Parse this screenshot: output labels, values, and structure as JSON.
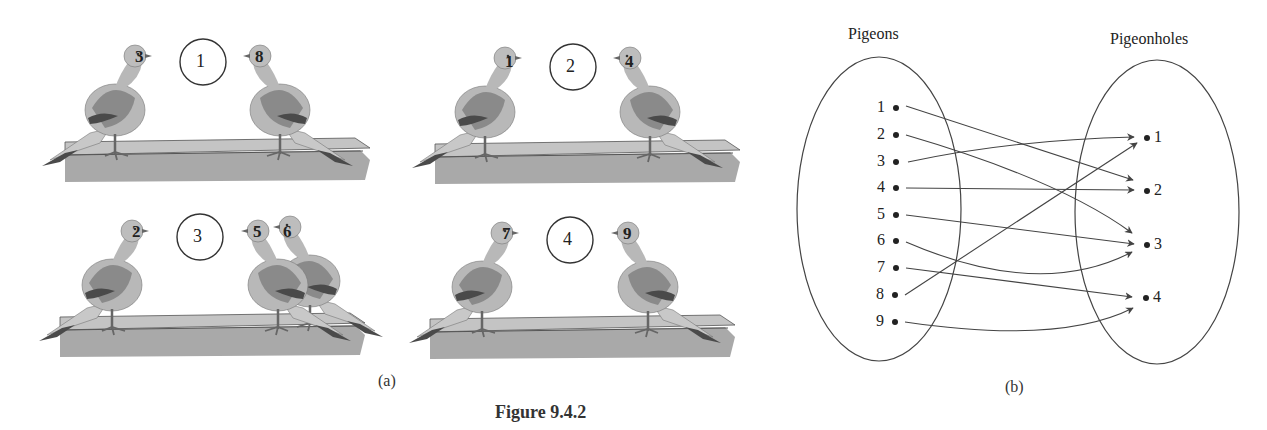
{
  "figure": {
    "title": "Figure 9.4.2",
    "panel_a_caption": "(a)",
    "panel_b_caption": "(b)"
  },
  "panel_a": {
    "cells": [
      {
        "hole": "1",
        "left_pigeons": [
          "3"
        ],
        "right_pigeons": [
          "8"
        ]
      },
      {
        "hole": "2",
        "left_pigeons": [
          "1"
        ],
        "right_pigeons": [
          "4"
        ]
      },
      {
        "hole": "3",
        "left_pigeons": [
          "2"
        ],
        "right_pigeons": [
          "5",
          "6"
        ]
      },
      {
        "hole": "4",
        "left_pigeons": [
          "7"
        ],
        "right_pigeons": [
          "9"
        ]
      }
    ]
  },
  "panel_b": {
    "pigeons_label": "Pigeons",
    "pigeonholes_label": "Pigeonholes",
    "pigeons": [
      "1",
      "2",
      "3",
      "4",
      "5",
      "6",
      "7",
      "8",
      "9"
    ],
    "pigeonholes": [
      "1",
      "2",
      "3",
      "4"
    ],
    "mapping": [
      {
        "from": "1",
        "to": "2"
      },
      {
        "from": "2",
        "to": "3"
      },
      {
        "from": "3",
        "to": "1"
      },
      {
        "from": "4",
        "to": "2"
      },
      {
        "from": "5",
        "to": "3"
      },
      {
        "from": "6",
        "to": "3"
      },
      {
        "from": "7",
        "to": "4"
      },
      {
        "from": "8",
        "to": "1"
      },
      {
        "from": "9",
        "to": "4"
      }
    ]
  },
  "colors": {
    "line": "#444444",
    "bird_body": "#b8b8b8",
    "bird_wing": "#8a8a8a",
    "bird_dark": "#4a4a4a",
    "box_top": "#c4c4c4",
    "box_side": "#a9a9a9"
  }
}
